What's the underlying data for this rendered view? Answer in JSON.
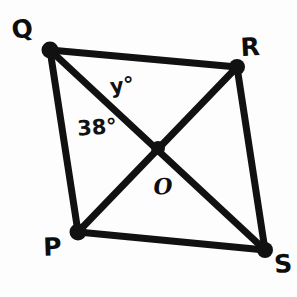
{
  "figure": {
    "type": "geometry-diagram",
    "shape": "quadrilateral-with-diagonals",
    "name": "Quadrilateral PQRS",
    "background_color": "#fdfdfd",
    "stroke_color": "#111111",
    "stroke_width": 7,
    "canvas": {
      "width": 297,
      "height": 297
    }
  },
  "vertices": [
    {
      "id": "Q",
      "label": "Q",
      "x": 50,
      "y": 50,
      "label_x": 22,
      "label_y": 29
    },
    {
      "id": "R",
      "label": "R",
      "x": 237,
      "y": 67,
      "label_x": 250,
      "label_y": 47
    },
    {
      "id": "P",
      "label": "P",
      "x": 78,
      "y": 232,
      "label_x": 52,
      "label_y": 247
    },
    {
      "id": "S",
      "label": "S",
      "x": 265,
      "y": 250,
      "label_x": 283,
      "label_y": 264
    }
  ],
  "intersection": {
    "id": "O",
    "label": "O",
    "x": 158,
    "y": 148,
    "label_x": 163,
    "label_y": 186
  },
  "edges": [
    {
      "id": "QR",
      "from": "Q",
      "to": "R"
    },
    {
      "id": "RS",
      "from": "R",
      "to": "S"
    },
    {
      "id": "SP",
      "from": "S",
      "to": "P"
    },
    {
      "id": "PQ",
      "from": "P",
      "to": "Q"
    }
  ],
  "diagonals": [
    {
      "id": "QS",
      "from": "Q",
      "to": "S"
    },
    {
      "id": "PR",
      "from": "P",
      "to": "R"
    }
  ],
  "angles": [
    {
      "id": "y",
      "label": "y°",
      "value": "y",
      "unit": "degrees",
      "at_vertex": "Q",
      "between": "QR and QS",
      "label_x": 122,
      "label_y": 86
    },
    {
      "id": "angle38",
      "label": "38°",
      "value": "38",
      "unit": "degrees",
      "at_vertex": "Q",
      "between": "QP and QS",
      "label_x": 97,
      "label_y": 128
    }
  ]
}
